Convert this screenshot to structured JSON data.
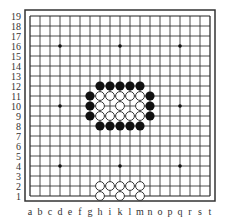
{
  "board": {
    "size": 19,
    "columns": [
      "a",
      "b",
      "c",
      "d",
      "e",
      "f",
      "g",
      "h",
      "i",
      "k",
      "l",
      "m",
      "n",
      "o",
      "p",
      "q",
      "r",
      "s",
      "t"
    ],
    "rows": [
      "1",
      "2",
      "3",
      "4",
      "5",
      "6",
      "7",
      "8",
      "9",
      "10",
      "11",
      "12",
      "13",
      "14",
      "15",
      "16",
      "17",
      "18",
      "19"
    ],
    "colors": {
      "background": "#ffffff",
      "line": "#222222",
      "border": "#333333",
      "black_stone": "#111111",
      "white_stone_fill": "#ffffff",
      "white_stone_stroke": "#222222",
      "label": "#333333"
    },
    "star_points": [
      "d4",
      "k4",
      "q4",
      "d10",
      "k10",
      "q10",
      "d16",
      "k16",
      "q16"
    ],
    "stones": {
      "black": [
        "h12",
        "i12",
        "k12",
        "l12",
        "m12",
        "g11",
        "n11",
        "g10",
        "n10",
        "g9",
        "n9",
        "h8",
        "i8",
        "k8",
        "l8",
        "m8"
      ],
      "white": [
        "h11",
        "i11",
        "k11",
        "l11",
        "m11",
        "h10",
        "k10",
        "m10",
        "h9",
        "i9",
        "k9",
        "l9",
        "m9",
        "h2",
        "i2",
        "k2",
        "l2",
        "m2",
        "h1",
        "k1",
        "m1"
      ]
    }
  }
}
